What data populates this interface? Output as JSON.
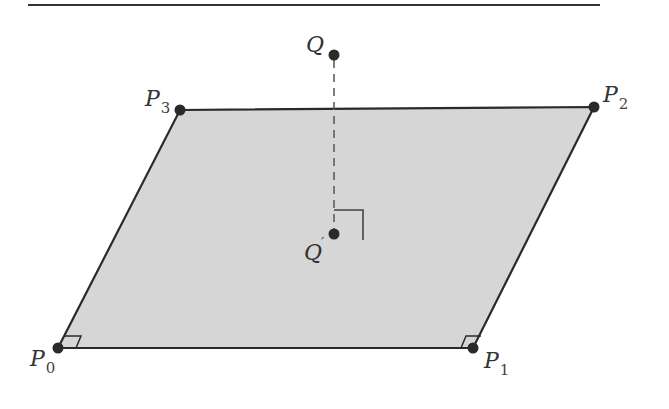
{
  "diagram": {
    "colors": {
      "fill": "#d6d6d6",
      "stroke": "#2a2a2a",
      "point": "#2a2a2a",
      "dashed": "#555555",
      "rule": "#333333"
    },
    "points": [
      {
        "id": "P0",
        "label": "P",
        "subscript": "0",
        "x": 58,
        "y": 348
      },
      {
        "id": "P1",
        "label": "P",
        "subscript": "1",
        "x": 473,
        "y": 348
      },
      {
        "id": "P2",
        "label": "P",
        "subscript": "2",
        "x": 594,
        "y": 107
      },
      {
        "id": "P3",
        "label": "P",
        "subscript": "3",
        "x": 180,
        "y": 110
      },
      {
        "id": "Q",
        "label": "Q",
        "subscript": "",
        "x": 334,
        "y": 55
      },
      {
        "id": "Qp",
        "label": "Q",
        "prime": "′",
        "x": 334,
        "y": 234
      }
    ],
    "labels": {
      "P0": {
        "main": "P",
        "sub": "0"
      },
      "P1": {
        "main": "P",
        "sub": "1"
      },
      "P2": {
        "main": "P",
        "sub": "2"
      },
      "P3": {
        "main": "P",
        "sub": "3"
      },
      "Q": {
        "main": "Q"
      },
      "Qp": {
        "main": "Q",
        "prime": "′"
      }
    },
    "right_angle_markers": [
      "P0",
      "P1",
      "Qp"
    ]
  }
}
